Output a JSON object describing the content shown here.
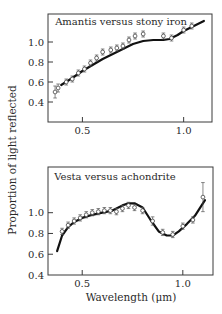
{
  "chart_data": [
    {
      "type": "scatter",
      "title": "Amantis versus stony iron",
      "xlabel": "",
      "ylabel": "Proportion of light reflected",
      "xticks": [
        "0.5",
        "1.0"
      ],
      "yticks": [
        "0.4",
        "0.6",
        "0.8",
        "1.0"
      ],
      "xlim": [
        0.33,
        1.14
      ],
      "ylim": [
        0.2,
        1.28
      ],
      "grid": false,
      "series": [
        {
          "name": "Amantis (asteroid, points with error bars)",
          "x": [
            0.365,
            0.38,
            0.42,
            0.45,
            0.48,
            0.51,
            0.54,
            0.57,
            0.6,
            0.64,
            0.67,
            0.7,
            0.73,
            0.76,
            0.8,
            0.9,
            0.94,
            1.0,
            1.04
          ],
          "y": [
            0.5,
            0.54,
            0.6,
            0.63,
            0.69,
            0.73,
            0.79,
            0.84,
            0.9,
            0.92,
            0.94,
            0.96,
            1.02,
            1.06,
            1.08,
            1.06,
            1.04,
            1.12,
            1.16
          ],
          "err": [
            0.06,
            0.04,
            0.03,
            0.03,
            0.03,
            0.03,
            0.03,
            0.03,
            0.03,
            0.03,
            0.03,
            0.03,
            0.03,
            0.03,
            0.03,
            0.03,
            0.03,
            0.03,
            0.03
          ]
        },
        {
          "name": "Stony iron (meteorite, solid curve)",
          "x": [
            0.395,
            0.45,
            0.5,
            0.55,
            0.6,
            0.65,
            0.7,
            0.75,
            0.8,
            0.85,
            0.9,
            0.93,
            0.97,
            1.0,
            1.05,
            1.1
          ],
          "y": [
            0.57,
            0.64,
            0.71,
            0.77,
            0.83,
            0.88,
            0.93,
            0.98,
            1.01,
            1.02,
            1.02,
            1.03,
            1.07,
            1.11,
            1.16,
            1.21
          ]
        }
      ]
    },
    {
      "type": "scatter",
      "title": "Vesta versus achondrite",
      "xlabel": "Wavelength (μm)",
      "ylabel": "Proportion of light reflected",
      "xticks": [
        "0.5",
        "1.0"
      ],
      "yticks": [
        "0.4",
        "0.6",
        "0.8",
        "1.0"
      ],
      "xlim": [
        0.33,
        1.15
      ],
      "ylim": [
        0.4,
        1.44
      ],
      "grid": false,
      "series": [
        {
          "name": "Vesta (asteroid, points with error bars)",
          "x": [
            0.4,
            0.43,
            0.46,
            0.49,
            0.52,
            0.55,
            0.58,
            0.61,
            0.64,
            0.67,
            0.7,
            0.73,
            0.76,
            0.8,
            0.85,
            0.9,
            0.95,
            1.0,
            1.05,
            1.1
          ],
          "y": [
            0.82,
            0.88,
            0.92,
            0.95,
            0.98,
            1.0,
            1.01,
            1.02,
            1.02,
            1.01,
            1.04,
            1.07,
            1.05,
            1.02,
            0.92,
            0.81,
            0.79,
            0.87,
            0.93,
            1.15
          ],
          "err": [
            0.03,
            0.03,
            0.03,
            0.03,
            0.03,
            0.03,
            0.03,
            0.03,
            0.03,
            0.03,
            0.03,
            0.03,
            0.03,
            0.03,
            0.04,
            0.03,
            0.03,
            0.03,
            0.03,
            0.14
          ]
        },
        {
          "name": "Achondrite (meteorite, solid curve)",
          "x": [
            0.375,
            0.4,
            0.43,
            0.46,
            0.5,
            0.55,
            0.6,
            0.65,
            0.7,
            0.73,
            0.76,
            0.8,
            0.84,
            0.88,
            0.92,
            0.95,
            0.98,
            1.02,
            1.06,
            1.11
          ],
          "y": [
            0.63,
            0.78,
            0.86,
            0.91,
            0.95,
            0.98,
            1.0,
            1.02,
            1.07,
            1.09,
            1.09,
            1.05,
            0.93,
            0.82,
            0.78,
            0.78,
            0.82,
            0.89,
            0.97,
            1.12
          ]
        }
      ]
    }
  ]
}
